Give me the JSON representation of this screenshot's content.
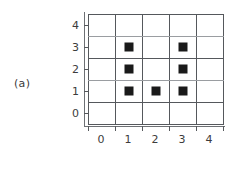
{
  "figure": {
    "label": "(a)"
  },
  "chart_data": {
    "type": "scatter",
    "title": "",
    "xlabel": "",
    "ylabel": "",
    "xlim": [
      0,
      5
    ],
    "ylim": [
      0,
      5
    ],
    "grid": true,
    "legend": null,
    "marker_style": "filled-square",
    "marker_color": "#1a1a1a",
    "grid_color": "#55585c",
    "axis_color": "#6d7074",
    "background_color": "#ffffff",
    "x_ticklabels": [
      "0",
      "1",
      "2",
      "3",
      "4"
    ],
    "y_ticklabels": [
      "4",
      "3",
      "2",
      "1",
      "0"
    ],
    "x": [
      1,
      2,
      3,
      1,
      3,
      1,
      3
    ],
    "y": [
      1,
      1,
      1,
      2,
      2,
      3,
      3
    ],
    "points": [
      {
        "x": 1,
        "y": 1
      },
      {
        "x": 2,
        "y": 1
      },
      {
        "x": 3,
        "y": 1
      },
      {
        "x": 1,
        "y": 2
      },
      {
        "x": 3,
        "y": 2
      },
      {
        "x": 1,
        "y": 3
      },
      {
        "x": 3,
        "y": 3
      }
    ],
    "point_count": 7
  }
}
